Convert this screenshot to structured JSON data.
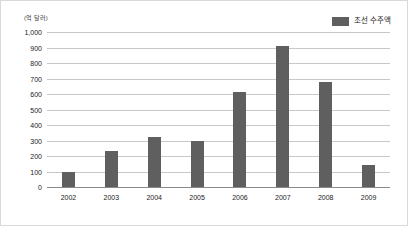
{
  "legend": {
    "label": "조선 수주액",
    "swatch_color": "#5f5f5f"
  },
  "axis": {
    "unit_label": "(억 달러)"
  },
  "chart_data": {
    "type": "bar",
    "title": "",
    "xlabel": "",
    "ylabel": "(억 달러)",
    "categories": [
      "2002",
      "2003",
      "2004",
      "2005",
      "2006",
      "2007",
      "2008",
      "2009"
    ],
    "values": [
      100,
      230,
      320,
      300,
      615,
      910,
      680,
      140
    ],
    "series": [
      {
        "name": "조선 수주액",
        "values": [
          100,
          230,
          320,
          300,
          615,
          910,
          680,
          140
        ]
      }
    ],
    "ylim": [
      0,
      1000
    ],
    "ytick_labels": [
      "1,000",
      "900",
      "800",
      "700",
      "600",
      "500",
      "400",
      "300",
      "200",
      "100",
      "0"
    ],
    "ytick_values": [
      1000,
      900,
      800,
      700,
      600,
      500,
      400,
      300,
      200,
      100,
      0
    ],
    "grid": true,
    "legend_position": "top-right",
    "bar_color": "#5f5f5f",
    "grid_color": "#c8c8c8"
  }
}
